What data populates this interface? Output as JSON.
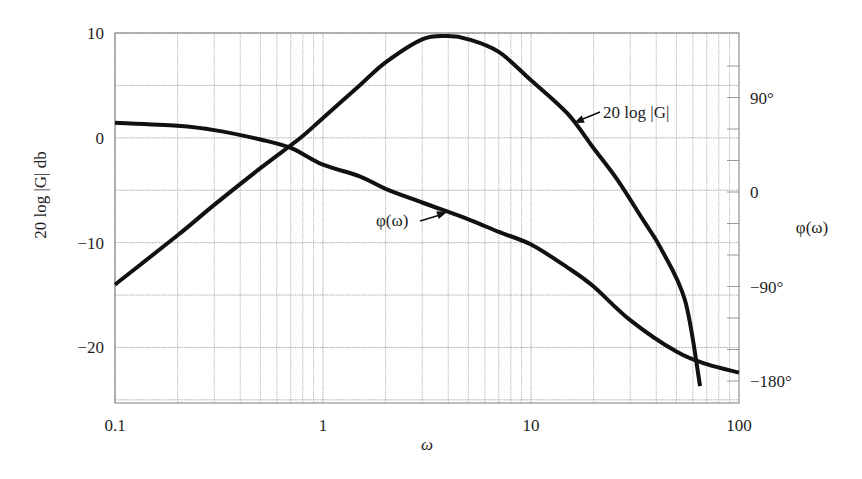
{
  "chart_data": {
    "type": "line",
    "title": "",
    "xlabel": "ω",
    "xscale": "log",
    "xlim": [
      0.1,
      100
    ],
    "x_ticks": [
      "0.1",
      "1",
      "10",
      "100"
    ],
    "left_axis": {
      "label": "20 log |G| db",
      "ylim": [
        -25.3,
        10
      ],
      "ticks": [
        "10",
        "0",
        "−10",
        "−20"
      ],
      "tick_values": [
        10,
        0,
        -10,
        -20
      ]
    },
    "right_axis": {
      "label": "φ(ω)",
      "ylim": [
        -190,
        135
      ],
      "ticks": [
        "90°",
        "0",
        "−90°",
        "−180°"
      ],
      "tick_values": [
        90,
        0,
        -90,
        -180
      ]
    },
    "grid": true,
    "series": [
      {
        "name": "20 log |G|",
        "axis": "left",
        "annotation": "20 log |G|",
        "x": [
          0.1,
          0.2,
          0.3,
          0.5,
          0.78,
          1.0,
          1.5,
          2.0,
          3.0,
          4.0,
          5.0,
          7.0,
          10.0,
          15.0,
          20.0,
          26.0,
          35.0,
          42.0,
          55.0,
          65.0
        ],
        "values": [
          -14.0,
          -9.3,
          -6.4,
          -2.9,
          0.0,
          1.9,
          5.0,
          7.2,
          9.4,
          9.7,
          9.4,
          8.2,
          5.5,
          2.3,
          -1.0,
          -4.0,
          -8.0,
          -10.5,
          -15.5,
          -23.7
        ]
      },
      {
        "name": "φ(ω)",
        "axis": "right",
        "annotation": "φ(ω)",
        "x": [
          0.1,
          0.2,
          0.3,
          0.5,
          0.7,
          1.0,
          1.5,
          2.0,
          3.0,
          5.0,
          7.0,
          10.0,
          15.0,
          20.0,
          30.0,
          50.0,
          70.0,
          100.0
        ],
        "values": [
          66,
          63,
          59,
          50,
          42,
          26,
          15,
          3,
          -10,
          -26,
          -38,
          -50,
          -72,
          -90,
          -122,
          -152,
          -164,
          -172
        ]
      }
    ],
    "annotations": [
      {
        "text": "20 log |G|",
        "points_to": "magnitude curve near ω≈17"
      },
      {
        "text": "φ(ω)",
        "points_to": "phase curve near ω≈4"
      }
    ]
  },
  "labels": {
    "x_axis": "ω",
    "left_axis": "20 log |G| db",
    "right_axis": "φ(ω)",
    "mag_annotation": "20 log |G|",
    "phase_annotation": "φ(ω)"
  },
  "style": {
    "curve_color": "#111111",
    "grid_color": "#9a9a9a",
    "frame_color": "#7a7a7a",
    "background": "#ffffff"
  }
}
